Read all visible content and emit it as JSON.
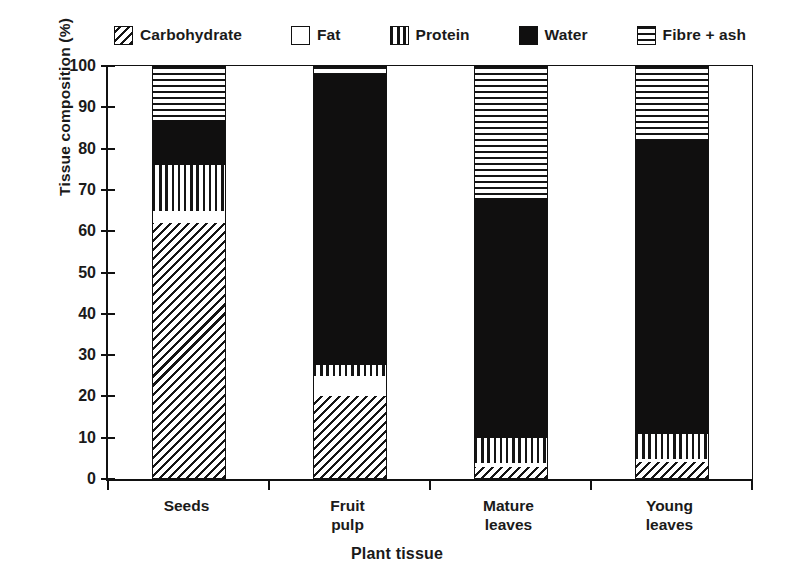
{
  "chart_data": {
    "type": "bar",
    "subtype": "stacked-bar",
    "title": "",
    "xlabel": "Plant tissue",
    "ylabel": "Tissue composition (%)",
    "ylim": [
      0,
      100
    ],
    "yticks": [
      0,
      10,
      20,
      30,
      40,
      50,
      60,
      70,
      80,
      90,
      100
    ],
    "grid": false,
    "legend_position": "top",
    "categories": [
      "Seeds",
      "Fruit pulp",
      "Mature leaves",
      "Young leaves"
    ],
    "category_lines": [
      [
        "Seeds"
      ],
      [
        "Fruit",
        "pulp"
      ],
      [
        "Mature",
        "leaves"
      ],
      [
        "Young",
        "leaves"
      ]
    ],
    "series": [
      {
        "name": "Carbohydrate",
        "pattern": "diagonal-hatch",
        "values": [
          62,
          20,
          3,
          4
        ]
      },
      {
        "name": "Fat",
        "pattern": "empty-white",
        "values": [
          3,
          5,
          0.8,
          0.8
        ]
      },
      {
        "name": "Protein",
        "pattern": "vertical-lines",
        "values": [
          11,
          2.5,
          6.2,
          6.2
        ]
      },
      {
        "name": "Water",
        "pattern": "solid-black",
        "values": [
          11,
          70.5,
          58,
          71
        ]
      },
      {
        "name": "Fibre + ash",
        "pattern": "horizontal-lines",
        "values": [
          13,
          2,
          32,
          18
        ]
      }
    ],
    "stack_boundaries": {
      "Seeds": [
        0,
        62,
        65,
        76,
        87,
        100
      ],
      "Fruit pulp": [
        0,
        20,
        25,
        27.5,
        98,
        100
      ],
      "Mature leaves": [
        0,
        3,
        3.8,
        10,
        68,
        100
      ],
      "Young leaves": [
        0,
        4,
        4.8,
        11,
        82,
        100
      ]
    }
  },
  "legend": {
    "items": [
      {
        "label": "Carbohydrate",
        "swatch": "diagonal-hatch-swatch"
      },
      {
        "label": "Fat",
        "swatch": "empty-white-swatch"
      },
      {
        "label": "Protein",
        "swatch": "vertical-lines-swatch"
      },
      {
        "label": "Water",
        "swatch": "solid-black-swatch"
      },
      {
        "label": "Fibre + ash",
        "swatch": "horizontal-lines-swatch"
      }
    ]
  },
  "axes": {
    "y_title": "Tissue composition (%)",
    "x_title": "Plant tissue",
    "y_tick_labels": [
      "100",
      "90",
      "80",
      "70",
      "60",
      "50",
      "40",
      "30",
      "20",
      "10",
      "0"
    ]
  },
  "colors": {
    "ink": "#111111",
    "paper": "#ffffff",
    "water_fill": "#100f0f"
  }
}
